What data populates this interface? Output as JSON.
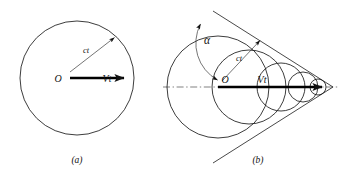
{
  "figure": {
    "background_color": "#ffffff",
    "line_color": "#1a1a1a",
    "bold_line_color": "#000000",
    "width": 339,
    "height": 178
  },
  "panel_a": {
    "caption": "(a)",
    "center_label": "O",
    "radius_label": "ct",
    "velocity_label": "Vt",
    "circle": {
      "cx": 77,
      "cy": 78,
      "r": 57
    },
    "radius_arrow": {
      "x1": 70,
      "y1": 72,
      "x2": 116,
      "y2": 36,
      "angle_deg": 38
    },
    "velocity_arrow": {
      "x1": 70,
      "y1": 78,
      "x2": 133,
      "y2": 78
    }
  },
  "panel_b": {
    "caption": "(b)",
    "center_label": "O",
    "radius_label": "ct",
    "velocity_label": "Vt",
    "angle_label": "α",
    "apex": {
      "x": 330,
      "y": 87
    },
    "main_circle": {
      "cx": 218,
      "cy": 87,
      "r": 51
    },
    "wavelet_circles": [
      {
        "cx": 249,
        "cy": 87,
        "r": 37
      },
      {
        "cx": 281,
        "cy": 87,
        "r": 24
      },
      {
        "cx": 303,
        "cy": 87,
        "r": 15
      },
      {
        "cx": 318,
        "cy": 87,
        "r": 8
      }
    ],
    "axis_line": {
      "x1": 163,
      "y1": 87,
      "x2": 339,
      "y2": 87
    },
    "velocity_arrow": {
      "x1": 218,
      "y1": 87,
      "x2": 332,
      "y2": 87
    },
    "radius_arrow": {
      "x1": 222,
      "y1": 80,
      "x2": 262,
      "y2": 38
    },
    "angle_arc": {
      "from_deg": 90,
      "to_deg": 153
    },
    "mach_angle_note": "alpha between axis and tangent"
  }
}
